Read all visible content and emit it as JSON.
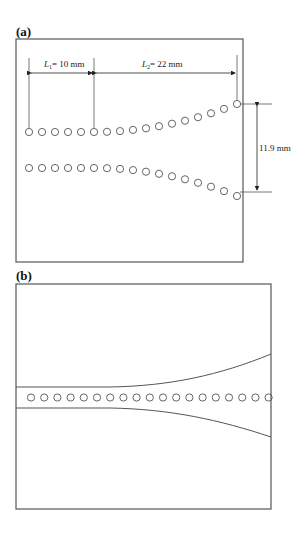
{
  "panel_a": {
    "label": "(a)",
    "dim_L1": {
      "symbol": "L",
      "sub": "1",
      "value": "= 10 mm"
    },
    "dim_L2": {
      "symbol": "L",
      "sub": "2",
      "value": "= 22 mm"
    },
    "dim_width": "11.9 mm",
    "rows": 2,
    "holes_per_row": 17
  },
  "panel_b": {
    "label": "(b)",
    "holes": 19
  },
  "colors": {
    "stroke": "#555555",
    "text": "#222222"
  }
}
